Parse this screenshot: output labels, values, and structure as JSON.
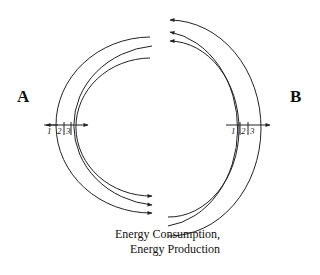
{
  "labels": {
    "left": "A",
    "right": "B"
  },
  "ticks": {
    "left": [
      "1",
      "2",
      "3"
    ],
    "right": [
      "1",
      "2",
      "3"
    ]
  },
  "caption": {
    "line1": "Energy Consumption,",
    "line2": "Energy Production"
  },
  "colors": {
    "stroke": "#222222",
    "background": "#ffffff"
  }
}
